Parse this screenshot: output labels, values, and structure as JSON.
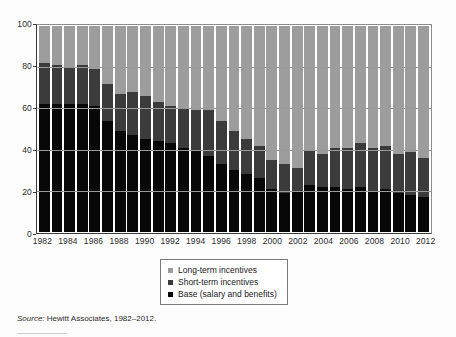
{
  "chart_data": {
    "type": "bar",
    "subtype": "stacked-column-100",
    "title": "",
    "xlabel": "",
    "ylabel": "",
    "ylim": [
      0,
      100
    ],
    "yticks": [
      0,
      20,
      40,
      60,
      80,
      100
    ],
    "ytick_labels": [
      "0",
      "20",
      "40",
      "60",
      "80",
      "100"
    ],
    "grid": true,
    "legend_position": "below-plot-center",
    "x": [
      1982,
      1983,
      1984,
      1985,
      1986,
      1987,
      1988,
      1989,
      1990,
      1991,
      1992,
      1993,
      1994,
      1995,
      1996,
      1997,
      1998,
      1999,
      2000,
      2001,
      2002,
      2003,
      2004,
      2005,
      2006,
      2007,
      2008,
      2009,
      2010,
      2011,
      2012
    ],
    "categories": [
      "1982",
      "1983",
      "1984",
      "1985",
      "1986",
      "1987",
      "1988",
      "1989",
      "1990",
      "1991",
      "1992",
      "1993",
      "1994",
      "1995",
      "1996",
      "1997",
      "1998",
      "1999",
      "2000",
      "2001",
      "2002",
      "2003",
      "2004",
      "2005",
      "2006",
      "2007",
      "2008",
      "2009",
      "2010",
      "2011",
      "2012"
    ],
    "xtick_labels": [
      "1982",
      "1984",
      "1986",
      "1988",
      "1990",
      "1992",
      "1994",
      "1996",
      "1998",
      "2000",
      "2002",
      "2004",
      "2006",
      "2008",
      "2010",
      "2012"
    ],
    "series": [
      {
        "name": "Base (salary and benefits)",
        "color": "#080808",
        "values": [
          62,
          62,
          62,
          62,
          61,
          54,
          49,
          47,
          45,
          44,
          43,
          41,
          40,
          37,
          33,
          30,
          28,
          26,
          21,
          19,
          20,
          23,
          22,
          22,
          21,
          22,
          20,
          21,
          19,
          18,
          17
        ]
      },
      {
        "name": "Short-term incentives",
        "color": "#3b3b3b",
        "values": [
          20,
          19,
          18,
          19,
          18,
          18,
          18,
          21,
          21,
          19,
          18,
          19,
          19,
          22,
          21,
          19,
          17,
          16,
          14,
          14,
          11,
          17,
          16,
          19,
          20,
          21,
          21,
          21,
          19,
          21,
          19
        ]
      },
      {
        "name": "Long-term incentives",
        "color": "#9d9d9d",
        "values": [
          18,
          19,
          20,
          19,
          21,
          28,
          33,
          32,
          34,
          37,
          39,
          40,
          41,
          41,
          46,
          51,
          55,
          58,
          65,
          67,
          69,
          60,
          62,
          59,
          59,
          57,
          59,
          58,
          62,
          61,
          64
        ]
      }
    ]
  },
  "legend": {
    "items": [
      {
        "label": "Long-term incentives",
        "color": "#9d9d9d"
      },
      {
        "label": "Short-term incentives",
        "color": "#3b3b3b"
      },
      {
        "label": "Base (salary and benefits)",
        "color": "#080808"
      }
    ]
  },
  "source": {
    "prefix": "Source:",
    "text": " Hewitt Associates, 1982–2012."
  }
}
